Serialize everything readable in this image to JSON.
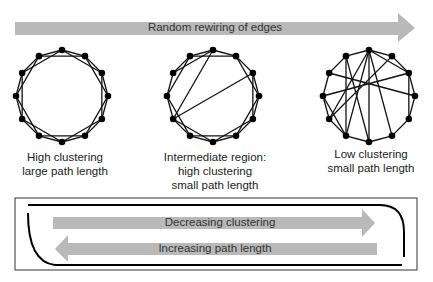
{
  "top_arrow": {
    "label": "Random rewiring of edges"
  },
  "networks": [
    {
      "id": "regular",
      "caption": [
        "High clustering",
        "large path length"
      ]
    },
    {
      "id": "small-world",
      "caption": [
        "Intermediate region:",
        "high clustering",
        "small path length"
      ]
    },
    {
      "id": "random",
      "caption": [
        "Low clustering",
        "small path length"
      ]
    }
  ],
  "bottom_box": {
    "arrow_right_label": "Decreasing clustering",
    "arrow_left_label": "Increasing path length"
  },
  "colors": {
    "arrow_fill": "#b8b8b8",
    "node": "#000000",
    "edge": "#111111",
    "box_border": "#333333"
  }
}
